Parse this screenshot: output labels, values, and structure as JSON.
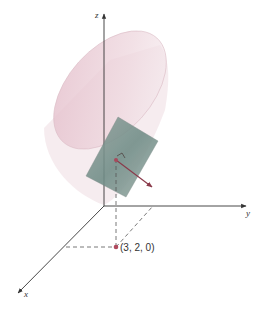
{
  "figure": {
    "axes": {
      "x_label": "x",
      "y_label": "y",
      "z_label": "z"
    },
    "point": {
      "label": "(3, 2, 0)",
      "coords": [
        3,
        2,
        0
      ]
    },
    "elements": {
      "surface": "paraboloid-cone surface (translucent pink)",
      "tangent_plane": "tangent plane (gray-green)",
      "normal_vector": "normal vector arrow (maroon)"
    },
    "colors": {
      "surface_fill": "#e8c9d2",
      "surface_edge": "#d9b5c0",
      "plane_fill": "#7f9690",
      "axis": "#333333",
      "dashed": "#555555",
      "normal": "#8a3a4a",
      "point": "#b04a5e"
    }
  }
}
